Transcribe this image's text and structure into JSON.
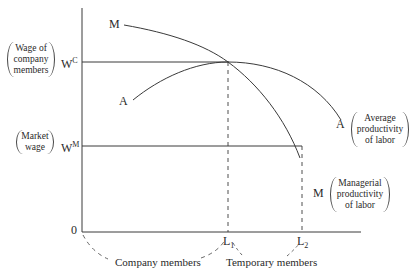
{
  "diagram": {
    "y_axis": {
      "origin_label": "0",
      "levels": [
        {
          "symbol": "W",
          "superscript": "C",
          "description": [
            "Wage of",
            "company",
            "members"
          ]
        },
        {
          "symbol": "W",
          "superscript": "M",
          "description": [
            "Market",
            "wage"
          ]
        }
      ]
    },
    "x_axis": {
      "ticks": [
        {
          "symbol": "L",
          "subscript": "1"
        },
        {
          "symbol": "L",
          "subscript": "2"
        }
      ],
      "brackets": [
        {
          "label": "Company members"
        },
        {
          "label": "Temporary members"
        }
      ]
    },
    "curves": [
      {
        "start_label": "M",
        "end_label": "M",
        "description": [
          "Managerial",
          "productivity",
          "of labor"
        ]
      },
      {
        "start_label": "A",
        "end_label": "A",
        "description": [
          "Average",
          "productivity",
          "of labor"
        ]
      }
    ],
    "colors": {
      "line": "#3a3a3a",
      "background": "#ffffff"
    }
  }
}
